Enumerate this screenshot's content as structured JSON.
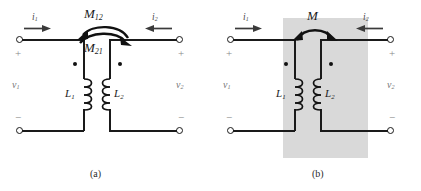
{
  "figure": {
    "type": "circuit-diagram",
    "background_color": "#ffffff",
    "wire_color": "#1a1a1a",
    "shade_color": "#d9d9d9"
  },
  "panel_a": {
    "caption": "(a)",
    "mutual_labels": {
      "top": "M",
      "top_sub": "12",
      "bottom": "M",
      "bottom_sub": "21"
    },
    "currents": [
      {
        "name": "i",
        "sub": "1",
        "direction": "right"
      },
      {
        "name": "i",
        "sub": "2",
        "direction": "left"
      }
    ],
    "voltages": [
      {
        "name": "v",
        "sub": "1",
        "plus": "+",
        "minus": "−"
      },
      {
        "name": "v",
        "sub": "2",
        "plus": "+",
        "minus": "−"
      }
    ],
    "inductors": [
      {
        "name": "L",
        "sub": "1"
      },
      {
        "name": "L",
        "sub": "2"
      }
    ],
    "dots": 2,
    "terminals": 4
  },
  "panel_b": {
    "caption": "(b)",
    "mutual_labels": {
      "top": "M",
      "top_sub": ""
    },
    "currents": [
      {
        "name": "i",
        "sub": "1",
        "direction": "right"
      },
      {
        "name": "i",
        "sub": "2",
        "direction": "left"
      }
    ],
    "voltages": [
      {
        "name": "v",
        "sub": "1",
        "plus": "+",
        "minus": "−"
      },
      {
        "name": "v",
        "sub": "2",
        "plus": "+",
        "minus": "−"
      }
    ],
    "inductors": [
      {
        "name": "L",
        "sub": "1"
      },
      {
        "name": "L",
        "sub": "2"
      }
    ],
    "dots": 2,
    "terminals": 4,
    "shaded_region": true
  }
}
